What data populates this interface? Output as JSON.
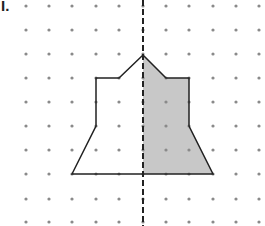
{
  "problem": {
    "label": "I.",
    "description": "Dot grid with a polygon symmetric about a dashed vertical line of symmetry; right half shaded"
  },
  "grid": {
    "columns_x": [
      26,
      49,
      72,
      96,
      119,
      143,
      166,
      189,
      213,
      236,
      259
    ],
    "rows_y": [
      6,
      30,
      54,
      78,
      102,
      126,
      150,
      174,
      199,
      222
    ],
    "dot_color": "#8a8a8a",
    "dot_radius": 1.6
  },
  "symmetry_line": {
    "x": 143,
    "y1": 0,
    "y2": 226,
    "color": "#222222"
  },
  "polygon": {
    "points": "72,174 96,126 96,78 119,78 143,55 166,78 189,78 189,126 213,174",
    "stroke": "#222222",
    "fill": "none"
  },
  "shaded_half": {
    "points": "143,55 166,78 189,78 189,126 213,174 143,174",
    "fill": "#c8c8c8"
  }
}
